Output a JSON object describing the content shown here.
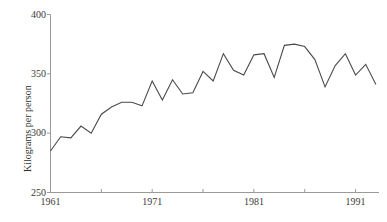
{
  "chart_data": {
    "type": "line",
    "title": "",
    "subtitle": "",
    "xlabel": "",
    "ylabel": "Kilograms per person",
    "xlim": [
      1961,
      1993
    ],
    "ylim": [
      250,
      400
    ],
    "grid": false,
    "legend": null,
    "y_ticks": [
      250,
      300,
      350,
      400
    ],
    "y_tick_labels": [
      "250",
      "300",
      "350",
      "400"
    ],
    "x_ticks": [
      1961,
      1966,
      1971,
      1976,
      1981,
      1986,
      1991
    ],
    "x_tick_labels": [
      "1961",
      "",
      "1971",
      "",
      "1981",
      "",
      "1991"
    ],
    "x_major_labels": [
      "1961",
      "1971",
      "1981",
      "1991"
    ],
    "line_color": "#4a4a4a",
    "axis_color": "#9a9a9a",
    "x": [
      1961,
      1962,
      1963,
      1964,
      1965,
      1966,
      1967,
      1968,
      1969,
      1970,
      1971,
      1972,
      1973,
      1974,
      1975,
      1976,
      1977,
      1978,
      1979,
      1980,
      1981,
      1982,
      1983,
      1984,
      1985,
      1986,
      1987,
      1988,
      1989,
      1990,
      1991,
      1992,
      1993
    ],
    "values": [
      285,
      297,
      296,
      306,
      300,
      316,
      322,
      326,
      326,
      323,
      344,
      328,
      345,
      333,
      334,
      352,
      344,
      367,
      353,
      349,
      366,
      367,
      347,
      374,
      375,
      373,
      362,
      339,
      357,
      367,
      349,
      358,
      341
    ],
    "series": [
      {
        "name": "Kilograms per person",
        "values": [
          285,
          297,
          296,
          306,
          300,
          316,
          322,
          326,
          326,
          323,
          344,
          328,
          345,
          333,
          334,
          352,
          344,
          367,
          353,
          349,
          366,
          367,
          347,
          374,
          375,
          373,
          362,
          339,
          357,
          367,
          349,
          358,
          341
        ]
      }
    ],
    "final_value": 345
  },
  "axis": {
    "y_title": "Kilograms per person"
  }
}
